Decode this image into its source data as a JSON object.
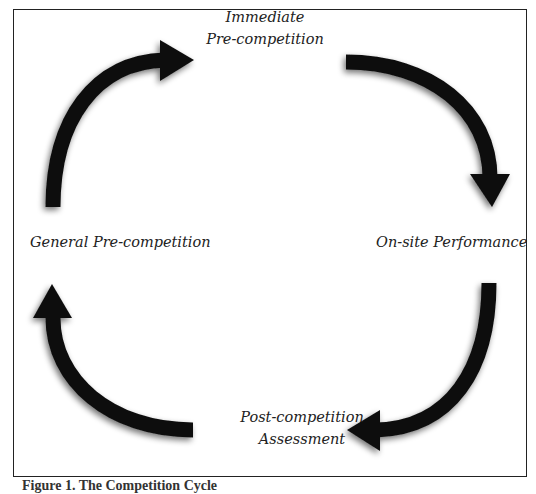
{
  "diagram": {
    "type": "cycle",
    "stages": [
      {
        "id": "immediate",
        "lines": [
          "Immediate",
          "Pre-competition"
        ]
      },
      {
        "id": "onsite",
        "lines": [
          "On-site Performance"
        ]
      },
      {
        "id": "post",
        "lines": [
          "Post-competition",
          "Assessment"
        ]
      },
      {
        "id": "general",
        "lines": [
          "General Pre-competition"
        ]
      }
    ],
    "arrows": [
      {
        "from": "general",
        "to": "immediate",
        "direction": "clockwise"
      },
      {
        "from": "immediate",
        "to": "onsite",
        "direction": "clockwise"
      },
      {
        "from": "onsite",
        "to": "post",
        "direction": "clockwise"
      },
      {
        "from": "post",
        "to": "general",
        "direction": "clockwise"
      }
    ],
    "arrow_color": "#111111"
  },
  "caption": "Figure 1. The Competition Cycle"
}
